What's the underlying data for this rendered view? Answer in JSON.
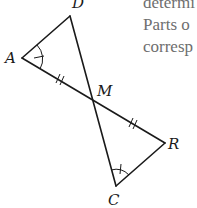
{
  "figure": {
    "points": {
      "D": {
        "label": "D",
        "x": 70,
        "y": 16
      },
      "A": {
        "label": "A",
        "x": 22,
        "y": 58
      },
      "M": {
        "label": "M",
        "x": 94,
        "y": 100
      },
      "R": {
        "label": "R",
        "x": 165,
        "y": 143
      },
      "C": {
        "label": "C",
        "x": 116,
        "y": 186
      }
    },
    "segments": [
      "AD",
      "DC",
      "AR",
      "RC"
    ],
    "congruence_marks": {
      "AM": "double-tick",
      "MR": "double-tick",
      "angle_A": "single-arc-tick",
      "angle_C": "single-arc-tick"
    }
  },
  "side_text": {
    "lines": [
      "determi",
      "Parts o",
      "corresp"
    ]
  }
}
